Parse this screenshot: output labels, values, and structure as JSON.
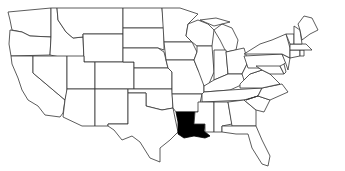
{
  "map": {
    "title": "",
    "region": "Contiguous United States",
    "highlighted_state": "Louisiana",
    "colors": {
      "background": "#ffffff",
      "state_fill": "#ffffff",
      "border": "#333333",
      "highlight_fill": "#000000"
    }
  }
}
